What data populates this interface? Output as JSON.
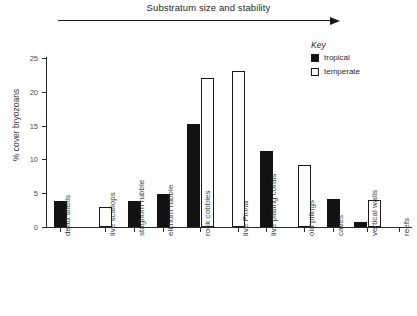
{
  "header": {
    "title": "Substratum size and stability",
    "arrow": "right-arrow"
  },
  "legend": {
    "title": "Key",
    "entries": [
      {
        "label": "tropical",
        "swatch": "filled-square",
        "color": "#121212"
      },
      {
        "label": "temperate",
        "swatch": "open-square",
        "color": "#ffffff"
      }
    ]
  },
  "axes": {
    "ylabel": "% cover bryozoans",
    "yticks": [
      "0",
      "5",
      "10",
      "15",
      "20",
      "25"
    ]
  },
  "chart_data": {
    "type": "bar",
    "title": "Substratum size and stability",
    "xlabel": "",
    "ylabel": "% cover bryozoans",
    "ylim": [
      0,
      25
    ],
    "yticks": [
      0,
      5,
      10,
      15,
      20,
      25
    ],
    "grid": false,
    "legend_position": "top-right",
    "categories": [
      "dead shells",
      "live scallops",
      "staghorn rubble",
      "elkhorn rubble",
      "rock cobbles",
      "live Pinna",
      "live plating corals",
      "old pilings",
      "caves",
      "vertical walls",
      "reefs"
    ],
    "series": [
      {
        "name": "tropical",
        "values": [
          3.9,
          0,
          3.9,
          4.9,
          15.2,
          0,
          11.2,
          0,
          4.1,
          0.7,
          0
        ]
      },
      {
        "name": "temperate",
        "values": [
          0,
          2.9,
          0,
          0,
          22.1,
          23.1,
          0,
          9.2,
          0,
          4.0,
          0
        ]
      }
    ],
    "annotations": [
      "Substratum size and stability arrow spanning categories left to right"
    ]
  }
}
